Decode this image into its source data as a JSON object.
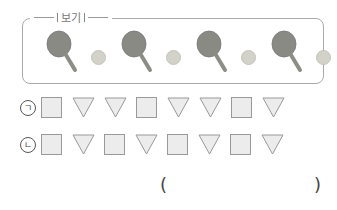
{
  "example_box": {
    "label": "보기",
    "pattern": [
      "paddle",
      "ball",
      "paddle",
      "ball",
      "paddle",
      "ball",
      "paddle",
      "ball"
    ]
  },
  "rows": [
    {
      "label": "ㄱ",
      "shapes": [
        "square",
        "triangle",
        "triangle",
        "square",
        "triangle",
        "triangle",
        "square",
        "triangle"
      ]
    },
    {
      "label": "ㄴ",
      "shapes": [
        "square",
        "triangle",
        "square",
        "triangle",
        "square",
        "triangle",
        "square",
        "triangle"
      ]
    }
  ],
  "answer": {
    "open": "(",
    "close": ")",
    "value": ""
  },
  "colors": {
    "paddle": "#8a8a85",
    "ball": "#d2d2c8",
    "shape_fill": "#ececec",
    "shape_stroke": "#999999"
  }
}
